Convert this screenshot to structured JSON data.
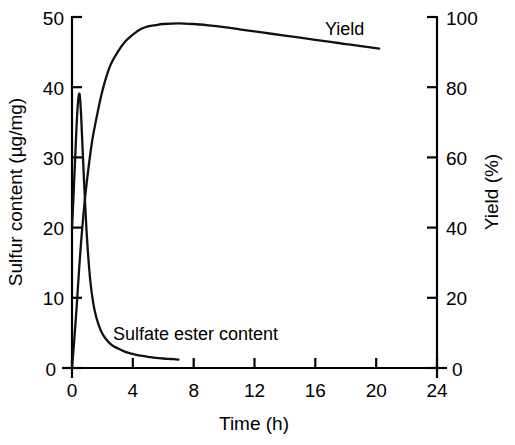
{
  "chart_data": {
    "type": "line",
    "title": "",
    "subtitle": "",
    "xlabel": "Time (h)",
    "ylabel": "Sulfur content (µg/mg)",
    "y2label": "Yield (%)",
    "xlim": [
      0,
      24
    ],
    "ylim": [
      0,
      50
    ],
    "y2lim": [
      0,
      100
    ],
    "grid": false,
    "legend_position": "inline-annotations",
    "xticks": [
      "0",
      "4",
      "8",
      "12",
      "16",
      "20",
      "24"
    ],
    "xtick_values": [
      0,
      4,
      8,
      12,
      16,
      20,
      24
    ],
    "yticks": [
      "0",
      "10",
      "20",
      "30",
      "40",
      "50"
    ],
    "ytick_values": [
      0,
      10,
      20,
      30,
      40,
      50
    ],
    "y2ticks": [
      "0",
      "20",
      "40",
      "60",
      "80",
      "100"
    ],
    "y2tick_values": [
      0,
      20,
      40,
      60,
      80,
      100
    ],
    "series": [
      {
        "name": "Yield",
        "axis": "right",
        "units": "%",
        "x": [
          0,
          0.15,
          0.3,
          0.45,
          0.6,
          0.8,
          1.0,
          1.3,
          1.6,
          2.0,
          2.5,
          3.0,
          3.5,
          4.0,
          4.5,
          5.0,
          5.5,
          6.0,
          7.0,
          8.0,
          9.0,
          10.0,
          11.0,
          12.0,
          13.0,
          14.0,
          15.0,
          16.0,
          17.0,
          18.0,
          19.0,
          20.2
        ],
        "values": [
          0,
          8,
          17,
          27,
          36,
          46,
          54,
          64,
          71,
          79,
          86,
          90,
          93,
          95,
          96.5,
          97.3,
          97.7,
          98.0,
          98.2,
          98.0,
          97.6,
          97.1,
          96.5,
          95.9,
          95.3,
          94.7,
          94.1,
          93.5,
          92.9,
          92.3,
          91.7,
          91.0
        ]
      },
      {
        "name": "Sulfate ester content",
        "axis": "left",
        "units": "µg/mg",
        "x": [
          0,
          0.1,
          0.2,
          0.3,
          0.4,
          0.5,
          0.6,
          0.7,
          0.85,
          1.0,
          1.2,
          1.4,
          1.6,
          1.9,
          2.2,
          2.6,
          3.0,
          3.5,
          4.0,
          4.5,
          5.0,
          5.5,
          6.0,
          6.5,
          7.0
        ],
        "values": [
          20.0,
          24.5,
          29.5,
          34.5,
          38.0,
          39.0,
          36.0,
          31.0,
          24.0,
          18.0,
          12.5,
          9.2,
          7.2,
          5.3,
          4.2,
          3.3,
          2.8,
          2.3,
          2.0,
          1.75,
          1.6,
          1.45,
          1.35,
          1.28,
          1.2
        ]
      }
    ],
    "annotations": [
      {
        "text": "Yield",
        "x": 16.0,
        "y_right": 99.5
      },
      {
        "text": "Sulfate ester content",
        "x": 3.5,
        "y_left": 6.5
      }
    ]
  },
  "colors": {
    "curve": "#111111",
    "axis": "#000000",
    "background": "#ffffff"
  }
}
